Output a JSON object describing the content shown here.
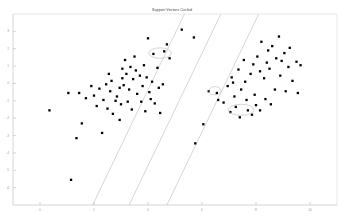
{
  "chart_data": {
    "type": "scatter",
    "title": "Support Vectors Circled",
    "xlabel": "",
    "ylabel": "",
    "xlim": [
      -1,
      11
    ],
    "ylim": [
      -7,
      4
    ],
    "grid": false,
    "legend": null,
    "xticks": [
      0,
      2,
      4,
      6,
      8,
      10
    ],
    "xtick_labels": [
      "0",
      "2",
      "4",
      "6",
      "8",
      "10"
    ],
    "yticks": [
      -6,
      -5,
      -4,
      -3,
      -2,
      -1,
      0,
      1,
      2,
      3
    ],
    "ytick_labels": [
      "-6",
      "-5",
      "-4",
      "-3",
      "-2",
      "-1",
      "0",
      "1",
      "2",
      "3"
    ],
    "marker": "square",
    "marker_color": "#000000",
    "line_color": "#b9b9c4",
    "circle_color": "#b9b9c4",
    "series": [
      {
        "name": "Class A",
        "points": [
          [
            0.35,
            -1.55
          ],
          [
            1.05,
            -0.55
          ],
          [
            1.7,
            -0.85
          ],
          [
            1.55,
            -2.3
          ],
          [
            2.45,
            -0.05
          ],
          [
            2.6,
            -0.45
          ],
          [
            2.8,
            -1.0
          ],
          [
            2.2,
            -0.3
          ],
          [
            2.95,
            -0.25
          ],
          [
            3.05,
            0.3
          ],
          [
            3.2,
            0.55
          ],
          [
            3.1,
            -0.1
          ],
          [
            2.85,
            -0.75
          ],
          [
            3.0,
            -1.2
          ],
          [
            2.35,
            -0.95
          ],
          [
            2.5,
            -1.45
          ],
          [
            3.35,
            0.95
          ],
          [
            3.55,
            0.75
          ],
          [
            3.45,
            0.25
          ],
          [
            3.3,
            -0.35
          ],
          [
            3.6,
            -0.6
          ],
          [
            3.25,
            -1.05
          ],
          [
            3.7,
            0.45
          ],
          [
            3.85,
            1.05
          ],
          [
            3.95,
            0.35
          ],
          [
            3.8,
            -0.15
          ],
          [
            4.05,
            -0.5
          ],
          [
            3.4,
            -1.5
          ],
          [
            2.1,
            -1.3
          ],
          [
            2.7,
            -1.75
          ],
          [
            1.9,
            -0.15
          ],
          [
            1.45,
            -0.55
          ],
          [
            3.15,
            1.35
          ],
          [
            3.5,
            1.55
          ],
          [
            4.2,
            1.7
          ],
          [
            4.35,
            0.9
          ],
          [
            4.15,
            0.1
          ],
          [
            4.4,
            -0.25
          ],
          [
            4.25,
            -1.15
          ],
          [
            4.55,
            -0.05
          ],
          [
            4.7,
            2.25
          ],
          [
            4.0,
            2.6
          ],
          [
            4.6,
            1.85
          ],
          [
            4.8,
            1.45
          ],
          [
            2.95,
            -2.1
          ],
          [
            2.3,
            -2.85
          ],
          [
            1.35,
            -3.15
          ],
          [
            1.15,
            -5.55
          ],
          [
            3.9,
            -1.6
          ],
          [
            4.45,
            -1.7
          ],
          [
            2.0,
            -0.7
          ],
          [
            2.65,
            0.15
          ],
          [
            3.05,
            0.85
          ],
          [
            2.55,
            0.55
          ],
          [
            3.75,
            -1.05
          ],
          [
            4.1,
            -0.9
          ],
          [
            5.25,
            3.1
          ],
          [
            5.7,
            2.65
          ]
        ]
      },
      {
        "name": "Class B",
        "points": [
          [
            6.55,
            -0.55
          ],
          [
            6.95,
            -0.15
          ],
          [
            7.2,
            -0.75
          ],
          [
            7.45,
            -0.35
          ],
          [
            7.1,
            0.35
          ],
          [
            7.6,
            0.1
          ],
          [
            7.35,
            0.8
          ],
          [
            7.8,
            0.55
          ],
          [
            7.55,
            1.35
          ],
          [
            7.9,
            1.1
          ],
          [
            8.15,
            0.7
          ],
          [
            8.05,
            1.55
          ],
          [
            8.3,
            0.3
          ],
          [
            8.45,
            1.9
          ],
          [
            8.2,
            2.4
          ],
          [
            8.6,
            2.15
          ],
          [
            8.75,
            1.45
          ],
          [
            8.5,
            0.85
          ],
          [
            8.9,
            0.45
          ],
          [
            9.05,
            1.75
          ],
          [
            8.85,
            2.7
          ],
          [
            9.2,
            0.95
          ],
          [
            9.35,
            0.15
          ],
          [
            9.1,
            -0.45
          ],
          [
            8.7,
            -0.35
          ],
          [
            8.35,
            -0.9
          ],
          [
            8.0,
            -1.25
          ],
          [
            7.7,
            -1.55
          ],
          [
            7.4,
            -1.95
          ],
          [
            7.25,
            -1.35
          ],
          [
            7.85,
            -1.8
          ],
          [
            8.15,
            -1.55
          ],
          [
            6.8,
            -1.1
          ],
          [
            6.6,
            -0.95
          ],
          [
            7.05,
            -1.65
          ],
          [
            7.95,
            -0.65
          ],
          [
            8.55,
            -1.2
          ],
          [
            9.5,
            1.25
          ],
          [
            9.65,
            1.05
          ],
          [
            9.55,
            -0.55
          ],
          [
            6.25,
            -0.45
          ],
          [
            6.05,
            -2.35
          ],
          [
            5.75,
            -3.45
          ],
          [
            9.25,
            2.05
          ],
          [
            7.15,
            0.05
          ],
          [
            7.65,
            -0.95
          ],
          [
            8.4,
            1.2
          ],
          [
            8.95,
            1.3
          ]
        ]
      }
    ],
    "support_vector_circles": [
      {
        "cx": 4.45,
        "cy": 1.75,
        "rx": 0.42,
        "ry": 0.3
      },
      {
        "cx": 6.48,
        "cy": -0.42,
        "rx": 0.22,
        "ry": 0.24
      },
      {
        "cx": 7.45,
        "cy": -1.52,
        "rx": 0.48,
        "ry": 0.32
      }
    ],
    "decision_lines": [
      {
        "name": "margin-lower",
        "x_at_ytop": 5.35,
        "x_at_ybottom": 1.95
      },
      {
        "name": "decision-boundary",
        "x_at_ytop": 6.7,
        "x_at_ybottom": 3.3
      },
      {
        "name": "margin-upper",
        "x_at_ytop": 8.1,
        "x_at_ybottom": 4.7
      }
    ]
  }
}
